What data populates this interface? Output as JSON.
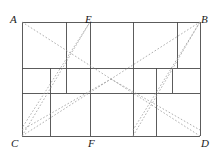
{
  "figure": {
    "type": "geometry-diagram",
    "colors": {
      "solid_line": "#4a4a4a",
      "dashed_line": "#9a9a9a",
      "label_text": "#1a1a1a",
      "background": "#ffffff"
    },
    "rect": {
      "left": 22,
      "top": 22,
      "right": 200,
      "bottom": 136
    },
    "labels": [
      {
        "name": "A",
        "text": "A",
        "x": 10,
        "y": 14
      },
      {
        "name": "E",
        "text": "E",
        "x": 85,
        "y": 14
      },
      {
        "name": "B",
        "text": "B",
        "x": 201,
        "y": 14
      },
      {
        "name": "C",
        "text": "C",
        "x": 11,
        "y": 138
      },
      {
        "name": "F",
        "text": "F",
        "x": 88,
        "y": 138
      },
      {
        "name": "D",
        "text": "D",
        "x": 201,
        "y": 138
      }
    ],
    "solid_segments": [
      {
        "name": "rect-top-AB",
        "x1": 22,
        "y1": 22,
        "x2": 200,
        "y2": 22
      },
      {
        "name": "rect-bottom-CD",
        "x1": 22,
        "y1": 136,
        "x2": 200,
        "y2": 136
      },
      {
        "name": "rect-left-AC",
        "x1": 22,
        "y1": 22,
        "x2": 22,
        "y2": 136
      },
      {
        "name": "rect-right-BD",
        "x1": 200,
        "y1": 22,
        "x2": 200,
        "y2": 136
      },
      {
        "name": "grid-h-upper",
        "x1": 22,
        "y1": 68,
        "x2": 200,
        "y2": 68
      },
      {
        "name": "grid-h-lower",
        "x1": 22,
        "y1": 93,
        "x2": 200,
        "y2": 93
      },
      {
        "name": "v-left-top-66",
        "x1": 66,
        "y1": 22,
        "x2": 66,
        "y2": 68
      },
      {
        "name": "v-left-top-90",
        "x1": 90,
        "y1": 22,
        "x2": 90,
        "y2": 68
      },
      {
        "name": "v-left-mid-50",
        "x1": 50,
        "y1": 68,
        "x2": 50,
        "y2": 93
      },
      {
        "name": "v-left-mid-66",
        "x1": 66,
        "y1": 68,
        "x2": 66,
        "y2": 93
      },
      {
        "name": "v-left-mid-90",
        "x1": 90,
        "y1": 68,
        "x2": 90,
        "y2": 93
      },
      {
        "name": "v-left-bot-50",
        "x1": 50,
        "y1": 93,
        "x2": 50,
        "y2": 136
      },
      {
        "name": "v-left-bot-90",
        "x1": 90,
        "y1": 93,
        "x2": 90,
        "y2": 136
      },
      {
        "name": "v-right-top-133",
        "x1": 133,
        "y1": 22,
        "x2": 133,
        "y2": 68
      },
      {
        "name": "v-right-top-177",
        "x1": 177,
        "y1": 22,
        "x2": 177,
        "y2": 68
      },
      {
        "name": "v-right-mid-133",
        "x1": 133,
        "y1": 68,
        "x2": 133,
        "y2": 93
      },
      {
        "name": "v-right-mid-156",
        "x1": 156,
        "y1": 68,
        "x2": 156,
        "y2": 93
      },
      {
        "name": "v-right-mid-172",
        "x1": 172,
        "y1": 68,
        "x2": 172,
        "y2": 93
      },
      {
        "name": "v-right-bot-133",
        "x1": 133,
        "y1": 93,
        "x2": 133,
        "y2": 136
      },
      {
        "name": "v-right-bot-156",
        "x1": 156,
        "y1": 93,
        "x2": 156,
        "y2": 136
      }
    ],
    "dashed_segments": [
      {
        "name": "diagonal-A-to-D",
        "x1": 22,
        "y1": 22,
        "x2": 200,
        "y2": 136
      },
      {
        "name": "diagonal-C-to-B",
        "x1": 22,
        "y1": 136,
        "x2": 200,
        "y2": 22
      },
      {
        "name": "diagonal-C-to-E",
        "x1": 22,
        "y1": 136,
        "x2": 90,
        "y2": 22
      },
      {
        "name": "diagonal-E-to-C2",
        "x1": 90,
        "y1": 22,
        "x2": 22,
        "y2": 128
      },
      {
        "name": "diagonal-F-to-B",
        "x1": 133,
        "y1": 136,
        "x2": 200,
        "y2": 22
      },
      {
        "name": "diagonal-B-to-F2",
        "x1": 200,
        "y1": 22,
        "x2": 133,
        "y2": 130
      },
      {
        "name": "diagonal-mid-left-up",
        "x1": 22,
        "y1": 130,
        "x2": 111,
        "y2": 79
      },
      {
        "name": "diagonal-mid-right-dn",
        "x1": 111,
        "y1": 79,
        "x2": 200,
        "y2": 130
      }
    ]
  }
}
